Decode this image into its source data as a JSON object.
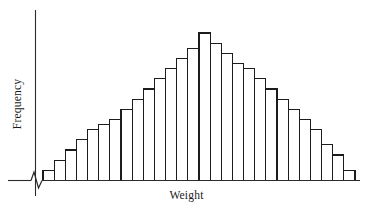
{
  "figure": {
    "width": 367,
    "height": 215,
    "background": "#ffffff",
    "line_color": "#1c1c1c",
    "bar_fill": "#ffffff",
    "axis_color": "#2b2b2b"
  },
  "axes": {
    "y_axis_label": "Frequency",
    "x_axis_label": "Weight",
    "y_axis_name": "y-axis-line",
    "x_axis_name": "x-axis-line",
    "break_symbol_name": "axis-break-zigzag",
    "has_break_symbol": true,
    "ticks_shown": false,
    "tick_labels_shown": false,
    "grid": false
  },
  "chart_data": {
    "type": "bar",
    "title": "",
    "subtitle": "",
    "xlabel": "Weight",
    "ylabel": "Frequency",
    "orientation": "vertical",
    "grid": false,
    "legend": null,
    "legend_position": "none",
    "axis_break": "x-axis origin break",
    "bar_count": 28,
    "bar_gap": 0,
    "ylim": [
      0,
      30
    ],
    "categories": [
      "1",
      "2",
      "3",
      "4",
      "5",
      "6",
      "7",
      "8",
      "9",
      "10",
      "11",
      "12",
      "13",
      "14",
      "15",
      "16",
      "17",
      "18",
      "19",
      "20",
      "21",
      "22",
      "23",
      "24",
      "25",
      "26",
      "27",
      "28"
    ],
    "values": [
      2,
      4,
      6,
      8,
      10,
      11,
      12,
      14,
      16,
      18,
      20,
      22,
      24,
      26,
      29,
      27,
      25,
      23,
      22,
      20,
      18,
      16,
      14,
      12,
      10,
      7,
      5,
      2
    ],
    "annotations": []
  }
}
